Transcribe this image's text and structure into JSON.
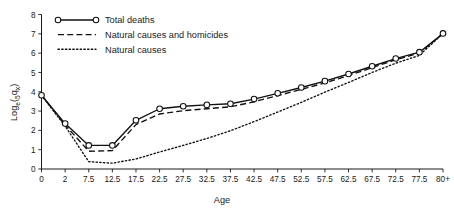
{
  "chart_data": {
    "type": "line",
    "title": "",
    "xlabel": "Age",
    "ylabel": "Log_e(5qx)",
    "ylabel_parts": {
      "main": "Log",
      "sub_e": "e",
      "open_paren": "(",
      "sub_5": "5",
      "q": "q",
      "sub_x": "x",
      "close_paren": ")"
    },
    "x": [
      0,
      2.5,
      7.5,
      12.5,
      17.5,
      22.5,
      27.5,
      32.5,
      37.5,
      42.5,
      47.5,
      52.5,
      57.5,
      62.5,
      67.5,
      72.5,
      77.5,
      82.5
    ],
    "categories": [
      "0",
      "2",
      "7.5",
      "12.5",
      "17.5",
      "22.5",
      "27.5",
      "32.5",
      "37.5",
      "42.5",
      "47.5",
      "52.5",
      "57.5",
      "62.5",
      "67.5",
      "72.5",
      "77.5",
      "80+"
    ],
    "xtick_labels": [
      "0",
      "2",
      "7.5",
      "12.5",
      "17.5",
      "22.5",
      "27.5",
      "32.5",
      "37.5",
      "42.5",
      "47.5",
      "52.5",
      "57.5",
      "62.5",
      "67.5",
      "72.5",
      "77.5",
      "80+"
    ],
    "ytick_labels": [
      "0",
      "1",
      "2",
      "3",
      "4",
      "5",
      "6",
      "7",
      "8"
    ],
    "ylim": [
      0,
      8
    ],
    "xlim_index": [
      0,
      17
    ],
    "grid": false,
    "legend_position": "top-left",
    "series": [
      {
        "name": "Total deaths",
        "style": "solid",
        "markers": true,
        "marker_shape": "open-circle",
        "color": "#111111",
        "values": [
          3.82,
          2.35,
          1.22,
          1.22,
          2.52,
          3.12,
          3.25,
          3.32,
          3.38,
          3.62,
          3.92,
          4.22,
          4.55,
          4.92,
          5.32,
          5.72,
          6.05,
          7.02
        ]
      },
      {
        "name": "Natural causes and homicides",
        "style": "dashed",
        "markers": false,
        "color": "#111111",
        "values": [
          3.82,
          2.28,
          0.92,
          0.95,
          2.3,
          2.85,
          3.02,
          3.12,
          3.22,
          3.48,
          3.8,
          4.12,
          4.46,
          4.84,
          5.25,
          5.66,
          6.0,
          7.02
        ]
      },
      {
        "name": "Natural causes",
        "style": "dotted",
        "markers": false,
        "color": "#111111",
        "values": [
          3.82,
          2.22,
          0.38,
          0.3,
          0.52,
          0.88,
          1.22,
          1.58,
          1.98,
          2.45,
          2.95,
          3.45,
          3.98,
          4.48,
          5.0,
          5.48,
          5.88,
          7.02
        ]
      }
    ]
  },
  "legend": {
    "items": [
      {
        "label": "Total deaths",
        "style": "solid",
        "marker": "open-circle"
      },
      {
        "label": "Natural causes and homicides",
        "style": "dashed",
        "marker": "none"
      },
      {
        "label": "Natural causes",
        "style": "dotted",
        "marker": "none"
      }
    ]
  },
  "axes": {
    "x_title": "Age",
    "y_title": "Log_e(5qx)"
  }
}
